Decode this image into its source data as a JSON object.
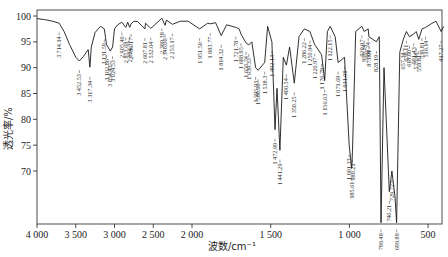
{
  "chart_data": {
    "type": "line",
    "title": "",
    "xlabel": "波数/cm⁻¹",
    "ylabel": "透光率/%",
    "x_reversed": true,
    "xlim": [
      4000,
      400
    ],
    "ylim": [
      60,
      100
    ],
    "x_ticks": [
      4000,
      3500,
      3000,
      2500,
      2000,
      1500,
      1000,
      500
    ],
    "x_tick_labels": [
      "4 000",
      "3 500",
      "3 000",
      "2 500",
      "2 000",
      "1 500",
      "1 000",
      "500"
    ],
    "y_ticks": [
      100,
      95,
      90,
      85,
      80,
      75,
      70
    ],
    "y_tick_labels": [
      "100",
      "95",
      "90",
      "85",
      "80",
      "75",
      "70"
    ],
    "grid": false,
    "legend": null,
    "series": [
      {
        "name": "IR spectrum",
        "x": [
          4000,
          3900,
          3800,
          3714,
          3650,
          3580,
          3500,
          3452.53,
          3400,
          3340,
          3317.34,
          3300,
          3250,
          3180,
          3131.59,
          3102.86,
          3054.43,
          3024.53,
          3000,
          2960,
          2905.4,
          2853.68,
          2830,
          2804.37,
          2786.17,
          2750,
          2700,
          2607.81,
          2600,
          2532.04,
          2450,
          2389.38,
          2346.66,
          2330,
          2253.17,
          2150,
          2050,
          1951.5,
          1900,
          1883.77,
          1850,
          1814.32,
          1780,
          1721.78,
          1700,
          1688.95,
          1656.74,
          1639.33,
          1620,
          1595.93,
          1580.06,
          1538.3,
          1520,
          1492.13,
          1472.99,
          1460,
          1441.29,
          1420,
          1400.54,
          1380,
          1350.25,
          1320,
          1286.22,
          1250.94,
          1220.97,
          1176.78,
          1156.63,
          1140,
          1122.15,
          1090,
          1071.69,
          1031.08,
          1001.33,
          985.61,
          980.21,
          960,
          920.97,
          906.24,
          880.74,
          875.91,
          828.19,
          810,
          799.48,
          780,
          746.21,
          729.72,
          710,
          699.89,
          680,
          657.34,
          638.11,
          618.6,
          591.43,
          575.48,
          558.81,
          538.81,
          516.14,
          480,
          450,
          417.27,
          400
        ],
        "y": [
          99.5,
          99.3,
          99.0,
          98.6,
          97.0,
          94.5,
          92.0,
          91.3,
          92.2,
          93.5,
          90.1,
          94.0,
          96.8,
          98.0,
          97.5,
          94.5,
          93.2,
          94.0,
          97.5,
          98.3,
          98.8,
          97.8,
          98.8,
          97.8,
          98.5,
          99.0,
          98.9,
          97.5,
          98.6,
          97.6,
          98.7,
          99.6,
          98.2,
          99.2,
          98.4,
          99.0,
          99.0,
          97.5,
          98.6,
          98.5,
          98.7,
          96.2,
          98.3,
          97.8,
          97.5,
          96.5,
          94.8,
          94.4,
          95.0,
          90.0,
          89.5,
          91.0,
          98.0,
          95.0,
          78.0,
          86.0,
          74.0,
          92.0,
          90.5,
          94.0,
          87.0,
          96.0,
          97.5,
          97.0,
          94.5,
          92.5,
          87.5,
          97.0,
          98.0,
          96.0,
          91.0,
          92.0,
          75.0,
          70.5,
          74.0,
          97.0,
          98.0,
          97.0,
          97.5,
          96.0,
          95.0,
          96.0,
          60.0,
          90.0,
          66.0,
          70.0,
          65.0,
          60.0,
          93.0,
          95.5,
          97.0,
          96.0,
          96.5,
          97.0,
          95.5,
          97.5,
          97.8,
          98.5,
          99.0,
          97.0,
          98.0
        ]
      }
    ],
    "annotations": [
      "3 714.14",
      "3 452.53",
      "3 317.34",
      "3 131.59",
      "3 102.86",
      "3 054.43",
      "3 024.53",
      "2 905.40",
      "2 853.68",
      "2 804.37",
      "2 786.17",
      "2 607.81",
      "2 532.04",
      "2 389.38",
      "2 346.66",
      "2 253.17",
      "1 951.50",
      "1 883.77",
      "1 814.32",
      "1 721.78",
      "1 688.95",
      "1 656.74",
      "1 639.33",
      "1 595.93",
      "1 580.06",
      "1 538.3",
      "1 492.13",
      "1 472.99",
      "1 441.29",
      "1 400.54",
      "1 350.25",
      "1 286.22",
      "1 250.94",
      "1 220.97",
      "1 176.78",
      "1 156.63",
      "1 122.15",
      "1 071.69",
      "1 031.08",
      "1 001.33",
      "985.61",
      "980.21",
      "920.97",
      "906.24",
      "880.74",
      "875.91",
      "828.19",
      "799.48",
      "746.21",
      "729.72",
      "699.89",
      "657.34",
      "638.11",
      "618.60",
      "591.43",
      "575.48",
      "558.81",
      "538.81",
      "516.14",
      "417.27"
    ]
  },
  "peak_labels": [
    {
      "text": "3 714.14",
      "x": 3714.14,
      "y0": 97.6,
      "len": 26
    },
    {
      "text": "3 452.53",
      "x": 3452.53,
      "y0": 90.3,
      "len": 26
    },
    {
      "text": "3 317.34",
      "x": 3317.34,
      "y0": 89.0,
      "len": 26
    },
    {
      "text": "3 131.59",
      "x": 3131.59,
      "y0": 96.3,
      "len": 18
    },
    {
      "text": "3 102.86",
      "x": 3102.86,
      "y0": 93.2,
      "len": 22
    },
    {
      "text": "3 054.43",
      "x": 3054.43,
      "y0": 92.0,
      "len": 26
    },
    {
      "text": "3 024.53",
      "x": 3024.53,
      "y0": 93.0,
      "len": 18
    },
    {
      "text": "2 905.40",
      "x": 2905.4,
      "y0": 97.6,
      "len": 18
    },
    {
      "text": "2 853.68",
      "x": 2853.68,
      "y0": 96.6,
      "len": 28
    },
    {
      "text": "2 804.37",
      "x": 2804.37,
      "y0": 96.8,
      "len": 18
    },
    {
      "text": "2 786.17",
      "x": 2786.17,
      "y0": 97.3,
      "len": 18
    },
    {
      "text": "2 607.81",
      "x": 2607.81,
      "y0": 96.5,
      "len": 18
    },
    {
      "text": "2 532.04",
      "x": 2532.04,
      "y0": 96.6,
      "len": 18
    },
    {
      "text": "2 389.38",
      "x": 2389.38,
      "y0": 98.4,
      "len": 18
    },
    {
      "text": "2 346.66",
      "x": 2346.66,
      "y0": 97.2,
      "len": 28
    },
    {
      "text": "2 253.17",
      "x": 2253.17,
      "y0": 97.4,
      "len": 18
    },
    {
      "text": "1 951.50",
      "x": 1951.5,
      "y0": 96.5,
      "len": 18
    },
    {
      "text": "1 883.77",
      "x": 1883.77,
      "y0": 97.5,
      "len": 18
    },
    {
      "text": "1 814.32",
      "x": 1814.32,
      "y0": 95.2,
      "len": 18
    },
    {
      "text": "1 721.78",
      "x": 1721.78,
      "y0": 96.8,
      "len": 18
    },
    {
      "text": "1 688.95",
      "x": 1688.95,
      "y0": 95.5,
      "len": 24
    },
    {
      "text": "1 656.74",
      "x": 1656.74,
      "y0": 93.8,
      "len": 28
    },
    {
      "text": "1 639.33",
      "x": 1639.33,
      "y0": 93.4,
      "len": 18
    },
    {
      "text": "1 595.93",
      "x": 1595.93,
      "y0": 89.0,
      "len": 16
    },
    {
      "text": "1 580.06",
      "x": 1580.06,
      "y0": 88.5,
      "len": 16
    },
    {
      "text": "1 538.3",
      "x": 1538.3,
      "y0": 90.0,
      "len": 14
    },
    {
      "text": "1 492.13",
      "x": 1492.13,
      "y0": 94.0,
      "len": 14
    },
    {
      "text": "1 472.99",
      "x": 1472.99,
      "y0": 77.0,
      "len": 18
    },
    {
      "text": "1 441.29",
      "x": 1441.29,
      "y0": 73.0,
      "len": 24
    },
    {
      "text": "1 400.54",
      "x": 1400.54,
      "y0": 89.5,
      "len": 18
    },
    {
      "text": "1 350.25",
      "x": 1350.25,
      "y0": 86.0,
      "len": 22
    },
    {
      "text": "1 286.22",
      "x": 1286.22,
      "y0": 96.5,
      "len": 14
    },
    {
      "text": "1 250.94",
      "x": 1250.94,
      "y0": 96.0,
      "len": 14
    },
    {
      "text": "1 220.97",
      "x": 1220.97,
      "y0": 93.5,
      "len": 18
    },
    {
      "text": "1 176.78",
      "x": 1176.78,
      "y0": 91.5,
      "len": 14
    },
    {
      "text": "1 156.63",
      "x": 1156.63,
      "y0": 86.5,
      "len": 20
    },
    {
      "text": "1 122.15",
      "x": 1122.15,
      "y0": 97.0,
      "len": 14
    },
    {
      "text": "1 071.69",
      "x": 1071.69,
      "y0": 90.0,
      "len": 18
    },
    {
      "text": "1 031.08",
      "x": 1031.08,
      "y0": 91.0,
      "len": 14
    },
    {
      "text": "1 001.33",
      "x": 1001.33,
      "y0": 74.0,
      "len": 16
    },
    {
      "text": "985.61",
      "x": 985.61,
      "y0": 69.5,
      "len": 26
    },
    {
      "text": "980.21",
      "x": 980.21,
      "y0": 73.0,
      "len": 12
    },
    {
      "text": "920.97",
      "x": 920.97,
      "y0": 97.0,
      "len": 14
    },
    {
      "text": "906.24",
      "x": 906.24,
      "y0": 96.0,
      "len": 14
    },
    {
      "text": "880.74",
      "x": 880.74,
      "y0": 96.5,
      "len": 14
    },
    {
      "text": "875.91",
      "x": 875.91,
      "y0": 95.0,
      "len": 20
    },
    {
      "text": "828.19",
      "x": 828.19,
      "y0": 94.0,
      "len": 14
    },
    {
      "text": "799.48",
      "x": 799.48,
      "y0": 59.5,
      "len": 14
    },
    {
      "text": "746.21",
      "x": 746.21,
      "y0": 65.0,
      "len": 16
    },
    {
      "text": "729.72",
      "x": 729.72,
      "y0": 69.0,
      "len": 14
    },
    {
      "text": "699.89",
      "x": 699.89,
      "y0": 59.5,
      "len": 14
    },
    {
      "text": "657.34",
      "x": 657.34,
      "y0": 94.5,
      "len": 14
    },
    {
      "text": "638.11",
      "x": 638.11,
      "y0": 96.0,
      "len": 14
    },
    {
      "text": "618.60",
      "x": 618.6,
      "y0": 95.0,
      "len": 16
    },
    {
      "text": "591.43",
      "x": 591.43,
      "y0": 95.5,
      "len": 14
    },
    {
      "text": "575.48",
      "x": 575.48,
      "y0": 94.5,
      "len": 16
    },
    {
      "text": "558.81",
      "x": 558.81,
      "y0": 94.0,
      "len": 22
    },
    {
      "text": "538.81",
      "x": 538.81,
      "y0": 96.5,
      "len": 14
    },
    {
      "text": "516.14",
      "x": 516.14,
      "y0": 96.8,
      "len": 18
    },
    {
      "text": "417.27",
      "x": 417.27,
      "y0": 96.0,
      "len": 16
    }
  ],
  "colors": {
    "line": "#1a1a1a",
    "axis": "#222222",
    "background": "#ffffff"
  }
}
